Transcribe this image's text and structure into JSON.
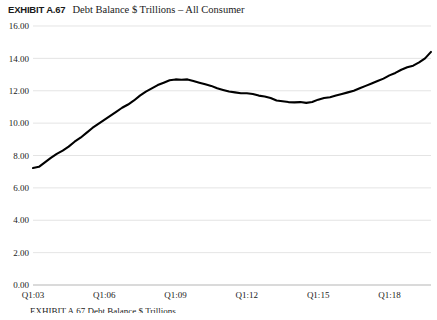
{
  "header": {
    "exhibit_label": "EXHIBIT A.67",
    "exhibit_title": "Debt Balance $ Trillions – All Consumer"
  },
  "footer": {
    "source_text": "EXHIBIT A.67  Debt Balance $ Trillions"
  },
  "chart_data": {
    "type": "line",
    "title": "Debt Balance $ Trillions – All Consumer",
    "xlabel": "",
    "ylabel": "",
    "ylim": [
      0.0,
      16.0
    ],
    "yticks": [
      "0.00",
      "2.00",
      "4.00",
      "6.00",
      "8.00",
      "10.00",
      "12.00",
      "14.00",
      "16.00"
    ],
    "ytick_values": [
      0,
      2,
      4,
      6,
      8,
      10,
      12,
      14,
      16
    ],
    "xticks": [
      "Q1:03",
      "Q1:06",
      "Q1:09",
      "Q1:12",
      "Q1:15",
      "Q1:18"
    ],
    "xtick_values": [
      0,
      12,
      24,
      36,
      48,
      60
    ],
    "grid": true,
    "legend": "none",
    "series": [
      {
        "name": "All Consumer Debt Balance",
        "color": "#000000",
        "x": [
          0,
          1,
          2,
          3,
          4,
          5,
          6,
          7,
          8,
          9,
          10,
          11,
          12,
          13,
          14,
          15,
          16,
          17,
          18,
          19,
          20,
          21,
          22,
          23,
          24,
          25,
          26,
          27,
          28,
          29,
          30,
          31,
          32,
          33,
          34,
          35,
          36,
          37,
          38,
          39,
          40,
          41,
          42,
          43,
          44,
          45,
          46,
          47,
          48,
          49,
          50,
          51,
          52,
          53,
          54,
          55,
          56,
          57,
          58,
          59,
          60,
          61,
          62,
          63,
          64,
          65,
          66,
          67
        ],
        "values": [
          7.23,
          7.3,
          7.58,
          7.85,
          8.1,
          8.3,
          8.55,
          8.85,
          9.1,
          9.4,
          9.7,
          9.95,
          10.2,
          10.45,
          10.7,
          10.95,
          11.15,
          11.4,
          11.7,
          11.95,
          12.15,
          12.35,
          12.5,
          12.65,
          12.7,
          12.68,
          12.7,
          12.6,
          12.5,
          12.4,
          12.3,
          12.15,
          12.05,
          11.95,
          11.9,
          11.85,
          11.85,
          11.8,
          11.7,
          11.65,
          11.55,
          11.4,
          11.35,
          11.3,
          11.28,
          11.3,
          11.25,
          11.3,
          11.45,
          11.55,
          11.6,
          11.7,
          11.8,
          11.9,
          12.0,
          12.15,
          12.3,
          12.45,
          12.6,
          12.75,
          12.95,
          13.1,
          13.3,
          13.45,
          13.55,
          13.75,
          14.0,
          14.4
        ]
      }
    ]
  }
}
